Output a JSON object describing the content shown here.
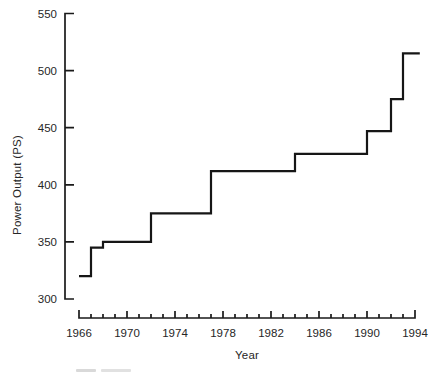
{
  "figure": {
    "background": "#ffffff",
    "text_color": "#262626"
  },
  "chart_data": {
    "type": "line",
    "subtype": "step",
    "title": "",
    "xlabel": "Year",
    "ylabel": "Power Output (PS)",
    "xlim": [
      1966,
      1994
    ],
    "ylim": [
      300,
      550
    ],
    "x_major_ticks": [
      1966,
      1970,
      1974,
      1978,
      1982,
      1986,
      1990,
      1994
    ],
    "x_minor_tick_interval": 1,
    "y_ticks": [
      300,
      350,
      400,
      450,
      500,
      550
    ],
    "grid": false,
    "legend": null,
    "line_color": "#161616",
    "steps": [
      {
        "year": 1966,
        "ps": 320
      },
      {
        "year": 1967,
        "ps": 345
      },
      {
        "year": 1968,
        "ps": 350
      },
      {
        "year": 1972,
        "ps": 375
      },
      {
        "year": 1977,
        "ps": 412
      },
      {
        "year": 1984,
        "ps": 427
      },
      {
        "year": 1990,
        "ps": 447
      },
      {
        "year": 1992,
        "ps": 475
      },
      {
        "year": 1993,
        "ps": 515
      }
    ],
    "end_year": 1994.4
  }
}
